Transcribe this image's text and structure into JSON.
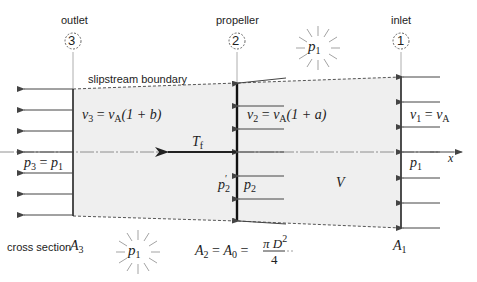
{
  "stations": {
    "outlet": {
      "label": "outlet",
      "number": "3"
    },
    "propeller": {
      "label": "propeller",
      "number": "2"
    },
    "inlet": {
      "label": "inlet",
      "number": "1"
    }
  },
  "slipstream_label": "slipstream boundary",
  "equations": {
    "v3": {
      "lhs": "v",
      "lhs_sub": "3",
      "eq": " = ",
      "rhs": "v",
      "rhs_sub": "A",
      "tail": "(1 + b)"
    },
    "v2": {
      "lhs": "v",
      "lhs_sub": "2",
      "eq": " = ",
      "rhs": "v",
      "rhs_sub": "A",
      "tail": "(1 + a)"
    },
    "v1": {
      "lhs": "v",
      "lhs_sub": "1",
      "eq": " = ",
      "rhs": "v",
      "rhs_sub": "A"
    },
    "p3": {
      "lhs": "p",
      "lhs_sub": "3",
      "eq": " = ",
      "rhs": "p",
      "rhs_sub": "1"
    },
    "p1_inlet": {
      "sym": "p",
      "sub": "1"
    },
    "p2": {
      "sym": "p",
      "sub": "2"
    },
    "p2_prime": {
      "sym": "p",
      "sup": "′",
      "sub": "2"
    },
    "thrust": {
      "sym": "T",
      "sub": "f"
    },
    "volume": {
      "sym": "V"
    },
    "x_axis": {
      "sym": "x"
    },
    "ambient_top": {
      "sym": "p",
      "sub": "1"
    },
    "ambient_bottom": {
      "sym": "p",
      "sub": "1"
    }
  },
  "cross_section": {
    "label": "cross section",
    "A3": {
      "sym": "A",
      "sub": "3"
    },
    "A1": {
      "sym": "A",
      "sub": "1"
    },
    "A2": {
      "a2": "A",
      "a2_sub": "2",
      "eq1": " = ",
      "a0": "A",
      "a0_sub": "0",
      "eq2": " = ",
      "num_pi": "π",
      "num_d": "D",
      "num_sup": "2",
      "den": "4"
    }
  },
  "colors": {
    "slipstream_fill": "#efefef",
    "line": "#333333",
    "arrow": "#444444",
    "text": "#222222"
  }
}
